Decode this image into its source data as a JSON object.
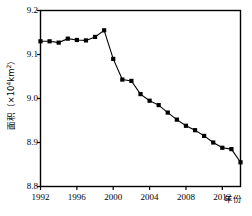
{
  "chart_data": {
    "type": "line",
    "title": "",
    "subtitle": "",
    "xlabel": "年份",
    "ylabel": "面积（×10⁴km²）",
    "ylabel_parts": {
      "prefix": "面积（×10",
      "exponent": "4",
      "suffix": "km",
      "unit_exponent": "2",
      "closing": "）"
    },
    "xlim": [
      1992,
      2014
    ],
    "ylim": [
      8.8,
      9.2
    ],
    "xticks": [
      1992,
      1996,
      2000,
      2004,
      2008,
      2012
    ],
    "xtick_labels": [
      "1992",
      "1996",
      "2000",
      "2004",
      "2008",
      "2012"
    ],
    "yticks": [
      8.8,
      8.9,
      9.0,
      9.1,
      9.2
    ],
    "ytick_labels": [
      "8.8",
      "8.9",
      "9.0",
      "9.1",
      "9.2"
    ],
    "grid": false,
    "legend": null,
    "marker": "square",
    "marker_color": "#000000",
    "line_color": "#000000",
    "axis_color": "#000000",
    "background": "#ffffff",
    "x": [
      1992,
      1993,
      1994,
      1995,
      1996,
      1997,
      1998,
      1999,
      2000,
      2001,
      2002,
      2003,
      2004,
      2005,
      2006,
      2007,
      2008,
      2009,
      2010,
      2011,
      2012,
      2013,
      2014
    ],
    "values": [
      9.13,
      9.13,
      9.127,
      9.136,
      9.133,
      9.132,
      9.14,
      9.155,
      9.09,
      9.043,
      9.04,
      9.01,
      8.995,
      8.985,
      8.968,
      8.952,
      8.938,
      8.928,
      8.915,
      8.9,
      8.888,
      8.885,
      8.855
    ],
    "series": [
      {
        "name": "面积",
        "values": [
          9.13,
          9.13,
          9.127,
          9.136,
          9.133,
          9.132,
          9.14,
          9.155,
          9.09,
          9.043,
          9.04,
          9.01,
          8.995,
          8.985,
          8.968,
          8.952,
          8.938,
          8.928,
          8.915,
          8.9,
          8.888,
          8.885,
          8.855
        ]
      }
    ],
    "annotations": []
  }
}
